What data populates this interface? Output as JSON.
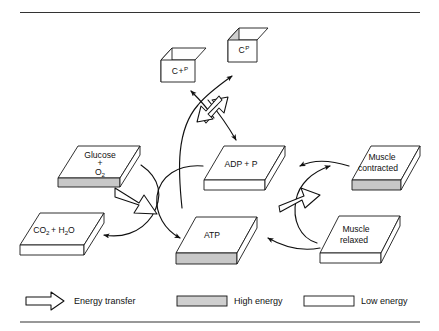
{
  "figure": {
    "type": "process-diagram",
    "title_rule_top": true,
    "title_rule_bottom": true,
    "background_color": "#ffffff",
    "line_color": "#111111",
    "high_energy_color": "#cfcfcf",
    "low_energy_color": "#ffffff"
  },
  "nodes": [
    {
      "id": "c-plus-p",
      "label": "C + P",
      "label_main": "C",
      "label_op": "+",
      "label_sup": "P",
      "shape": "vertical-slab",
      "energy": "low",
      "energy_label": "Low energy"
    },
    {
      "id": "cp",
      "label": "CP",
      "label_main": "C",
      "label_sup": "P",
      "shape": "vertical-slab",
      "energy": "high",
      "energy_label": "High energy"
    },
    {
      "id": "glucose-o2",
      "label": "Glucose + O2",
      "line1": "Glucose",
      "line2": "+",
      "line3_main": "O",
      "line3_sub": "2",
      "shape": "flat-slab",
      "energy": "high",
      "energy_label": "High energy"
    },
    {
      "id": "co2-h2o",
      "label": "CO2 + H2O",
      "seg1_main": "CO",
      "seg1_sub": "2",
      "seg2": "+ H",
      "seg2_sub": "2",
      "seg3": "O",
      "shape": "flat-slab",
      "energy": "low",
      "energy_label": "Low energy"
    },
    {
      "id": "adp-p",
      "label": "ADP + P",
      "shape": "flat-slab",
      "energy": "low",
      "energy_label": "Low energy"
    },
    {
      "id": "atp",
      "label": "ATP",
      "shape": "flat-slab",
      "energy": "high",
      "energy_label": "High energy"
    },
    {
      "id": "muscle-contracted",
      "label": "Muscle contracted",
      "line1": "Muscle",
      "line2": "contracted",
      "shape": "flat-slab",
      "energy": "high",
      "energy_label": "High energy"
    },
    {
      "id": "muscle-relaxed",
      "label": "Muscle relaxed",
      "line1": "Muscle",
      "line2": "relaxed",
      "shape": "flat-slab",
      "energy": "low",
      "energy_label": "Low energy"
    }
  ],
  "flows": [
    {
      "id": "glucose-to-co2",
      "from": "glucose-o2",
      "to": "co2-h2o",
      "kind": "curved-arrow"
    },
    {
      "id": "adp-to-atp",
      "from": "adp-p",
      "to": "atp",
      "kind": "curved-arrow"
    },
    {
      "id": "atp-to-adp",
      "from": "atp",
      "to": "adp-p",
      "kind": "curved-arrow"
    },
    {
      "id": "atp-to-cp",
      "from": "atp",
      "to": "cp",
      "kind": "curved-arrow"
    },
    {
      "id": "cp-to-c-plus-p",
      "from": "cp",
      "to": "c-plus-p",
      "kind": "curved-arrow"
    },
    {
      "id": "relaxed-to-contracted",
      "from": "muscle-relaxed",
      "to": "muscle-contracted",
      "kind": "curved-arrow"
    },
    {
      "id": "contracted-to-adp",
      "from": "muscle-contracted",
      "to": "adp-p",
      "kind": "curved-arrow"
    },
    {
      "id": "relaxed-to-atp",
      "from": "muscle-relaxed",
      "to": "atp",
      "kind": "curved-arrow"
    }
  ],
  "energy_transfers": [
    {
      "id": "transfer-glycolysis",
      "direction": "down-right",
      "between": "glucose-o2 -> atp"
    },
    {
      "id": "transfer-phosphocreatine",
      "direction": "bidirectional",
      "between": "atp <-> cp"
    },
    {
      "id": "transfer-contraction",
      "direction": "up-right",
      "between": "atp -> muscle-contracted"
    }
  ],
  "legend": {
    "items": [
      {
        "id": "energy-transfer",
        "label": "Energy transfer",
        "swatch": "hollow-arrow"
      },
      {
        "id": "high-energy",
        "label": "High energy",
        "swatch": "gray-bar",
        "color": "#cfcfcf"
      },
      {
        "id": "low-energy",
        "label": "Low energy",
        "swatch": "white-bar",
        "color": "#ffffff"
      }
    ]
  }
}
